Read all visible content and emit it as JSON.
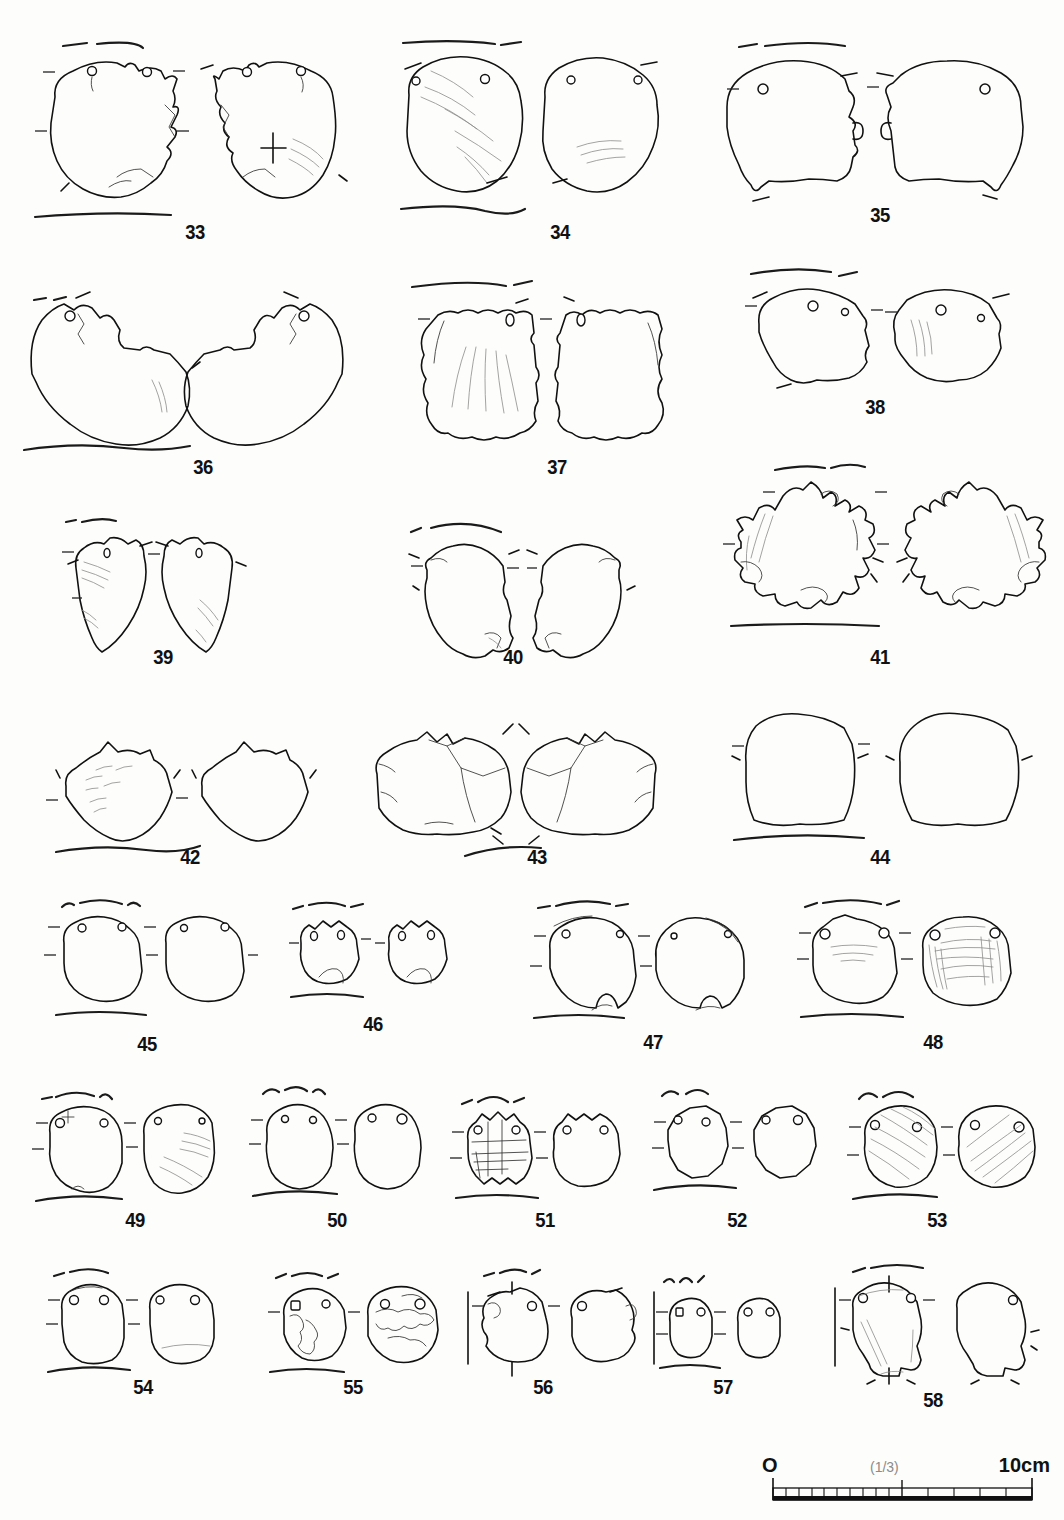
{
  "plate": {
    "type": "archaeological-artifact-illustration-plate",
    "description": "Line-drawing plate of perforated stone/shell artifacts, each shown in two views (obverse and reverse) with edge profile lines and registration tick marks.",
    "figure_count": 26,
    "number_range": "33-58"
  },
  "scale_bar": {
    "zero_label": "O",
    "fraction_label": "(1/3)",
    "max_label": "10cm",
    "major_divisions": 10,
    "fine_divisions_left": 10,
    "coarse_divisions_right": 5
  },
  "caption": {
    "text": ""
  },
  "colors": {
    "ink": "#111111",
    "faint_ink": "#8b8b8b",
    "paper": "#fdfdfb",
    "scale_gray": "#8a8a8a"
  },
  "rows": [
    {
      "row_index": 0,
      "items": [
        {
          "number": "33",
          "holes": 2,
          "views": 2,
          "shape": "round-disc",
          "has_profile_top": true,
          "has_profile_bottom": true,
          "surface_marks": "cross-mark and faint striations on right view"
        },
        {
          "number": "34",
          "holes": 2,
          "views": 2,
          "shape": "round-disc",
          "has_profile_top": true,
          "has_profile_bottom": true,
          "surface_marks": "diagonal striations both views"
        },
        {
          "number": "35",
          "holes": 1,
          "views": 2,
          "shape": "round-disc-notched",
          "has_profile_top": true,
          "has_profile_bottom": false,
          "surface_marks": "none"
        }
      ]
    },
    {
      "row_index": 1,
      "items": [
        {
          "number": "36",
          "holes": 1,
          "views": 2,
          "shape": "notched-disc",
          "has_profile_top": true,
          "has_profile_bottom": true,
          "surface_marks": "faint striations lower right"
        },
        {
          "number": "37",
          "holes": 1,
          "views": 2,
          "shape": "fan-shell",
          "has_profile_top": true,
          "has_profile_bottom": false,
          "surface_marks": "radial ribs"
        },
        {
          "number": "38",
          "holes": 2,
          "views": 2,
          "shape": "irregular-disc",
          "has_profile_top": true,
          "has_profile_bottom": false,
          "surface_marks": "faint striations on right view"
        }
      ]
    },
    {
      "row_index": 2,
      "items": [
        {
          "number": "39",
          "holes": 1,
          "views": 2,
          "shape": "pointed-blade",
          "has_profile_top": true,
          "has_profile_bottom": false,
          "surface_marks": "fine striations"
        },
        {
          "number": "40",
          "holes": 0,
          "views": 2,
          "shape": "lobed-fragment",
          "has_profile_top": true,
          "has_profile_bottom": false,
          "surface_marks": "faint"
        },
        {
          "number": "41",
          "holes": 0,
          "views": 2,
          "shape": "serrated-disc",
          "has_profile_top": true,
          "has_profile_bottom": true,
          "surface_marks": "heavy edge retouch"
        }
      ]
    },
    {
      "row_index": 3,
      "items": [
        {
          "number": "42",
          "holes": 0,
          "views": 2,
          "shape": "pointed-oval",
          "has_profile_top": false,
          "has_profile_bottom": true,
          "surface_marks": "short striations"
        },
        {
          "number": "43",
          "holes": 0,
          "views": 2,
          "shape": "broad-fragment",
          "has_profile_top": false,
          "has_profile_bottom": true,
          "surface_marks": "break facets"
        },
        {
          "number": "44",
          "holes": 0,
          "views": 2,
          "shape": "elongated-slab",
          "has_profile_top": false,
          "has_profile_bottom": true,
          "surface_marks": "none"
        }
      ]
    },
    {
      "row_index": 4,
      "items": [
        {
          "number": "45",
          "holes": 2,
          "views": 2,
          "shape": "rounded-square",
          "has_profile_top": true,
          "has_profile_bottom": true,
          "surface_marks": "none"
        },
        {
          "number": "46",
          "holes": 2,
          "views": 2,
          "shape": "small-oval",
          "has_profile_top": true,
          "has_profile_bottom": true,
          "surface_marks": "basal notch"
        },
        {
          "number": "47",
          "holes": 2,
          "views": 2,
          "shape": "round-disc",
          "has_profile_top": true,
          "has_profile_bottom": true,
          "surface_marks": "edge chipping"
        },
        {
          "number": "48",
          "holes": 2,
          "views": 2,
          "shape": "round-disc",
          "has_profile_top": true,
          "has_profile_bottom": true,
          "surface_marks": "dense cross-hatched striations on right view"
        }
      ]
    },
    {
      "row_index": 5,
      "items": [
        {
          "number": "49",
          "holes": 2,
          "views": 2,
          "shape": "oval-disc",
          "has_profile_top": true,
          "has_profile_bottom": true,
          "surface_marks": "diagonal striations right view"
        },
        {
          "number": "50",
          "holes": 2,
          "views": 2,
          "shape": "oval-disc",
          "has_profile_top": true,
          "has_profile_bottom": true,
          "surface_marks": "none"
        },
        {
          "number": "51",
          "holes": 2,
          "views": 2,
          "shape": "lobed-disc",
          "has_profile_top": true,
          "has_profile_bottom": true,
          "surface_marks": "grid of incised lines left view"
        },
        {
          "number": "52",
          "holes": 2,
          "views": 2,
          "shape": "angular-disc",
          "has_profile_top": true,
          "has_profile_bottom": true,
          "surface_marks": "none"
        },
        {
          "number": "53",
          "holes": 2,
          "views": 2,
          "shape": "oval-disc",
          "has_profile_top": true,
          "has_profile_bottom": true,
          "surface_marks": "strong diagonal striations both views"
        }
      ]
    },
    {
      "row_index": 6,
      "items": [
        {
          "number": "54",
          "holes": 2,
          "views": 2,
          "shape": "rounded-square",
          "has_profile_top": true,
          "has_profile_bottom": true,
          "surface_marks": "none"
        },
        {
          "number": "55",
          "holes": 2,
          "views": 2,
          "shape": "round-disc",
          "has_profile_top": true,
          "has_profile_bottom": true,
          "surface_marks": "irregular weathering patches"
        },
        {
          "number": "56",
          "holes": 2,
          "views": 2,
          "shape": "notched-square",
          "has_profile_top": true,
          "has_profile_bottom": false,
          "surface_marks": "none"
        },
        {
          "number": "57",
          "holes": 2,
          "views": 2,
          "shape": "small-oval",
          "has_profile_top": true,
          "has_profile_bottom": true,
          "surface_marks": "none"
        },
        {
          "number": "58",
          "holes": 2,
          "views": 2,
          "shape": "stemmed-weight",
          "has_profile_top": true,
          "has_profile_bottom": false,
          "surface_marks": "faint vertical striations"
        }
      ]
    }
  ]
}
